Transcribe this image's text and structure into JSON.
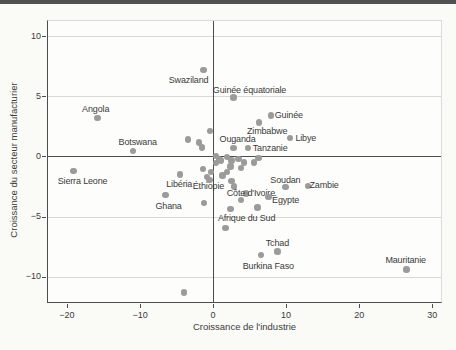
{
  "window": {
    "top_bar_color": "#515151",
    "background": "#fafaf7"
  },
  "chart_data": {
    "type": "scatter",
    "title": "",
    "xlabel": "Croissance de l'industrie",
    "ylabel": "Croissance du secteur manufacturier",
    "xlim": [
      -22.6,
      31.2
    ],
    "ylim": [
      -12.1,
      11.25
    ],
    "x_ticks": [
      -20,
      -10,
      0,
      10,
      20,
      30
    ],
    "y_ticks": [
      10,
      5,
      0,
      -5,
      -10
    ],
    "grid": "horizontal gridlines at -10,-5,5,10; dark zero axes both directions",
    "legend": "none",
    "point_color": "#9b9b9b",
    "axis_color": "#4d4d4d",
    "grid_color": "#d9d9d4",
    "labeled_points": [
      {
        "name": "Swaziland",
        "x": -1.3,
        "y": 7.2,
        "dx": -15,
        "dy": 10
      },
      {
        "name": "Guinée équatoriale",
        "x": 2.8,
        "y": 4.9,
        "dx": 16,
        "dy": -7
      },
      {
        "name": "Guinée",
        "x": 7.9,
        "y": 3.4,
        "dx": 18,
        "dy": 0
      },
      {
        "name": "Angola",
        "x": -15.8,
        "y": 3.2,
        "dx": -2,
        "dy": -9
      },
      {
        "name": "Zimbabwe",
        "x": 6.3,
        "y": 2.8,
        "dx": 8,
        "dy": 8
      },
      {
        "name": "Libye",
        "x": 10.5,
        "y": 1.55,
        "dx": 16,
        "dy": 0
      },
      {
        "name": "Botswana",
        "x": -11.0,
        "y": 0.45,
        "dx": 5,
        "dy": -9
      },
      {
        "name": "Ouganda",
        "x": 2.8,
        "y": 0.7,
        "dx": 4,
        "dy": -9
      },
      {
        "name": "Tanzanie",
        "x": 4.8,
        "y": 0.7,
        "dx": 22,
        "dy": 0
      },
      {
        "name": "Sierra Leone",
        "x": -19.1,
        "y": -1.2,
        "dx": 9,
        "dy": 10
      },
      {
        "name": "Libéria",
        "x": -4.5,
        "y": -1.5,
        "dx": -1,
        "dy": 10
      },
      {
        "name": "Éthiopie",
        "x": -0.5,
        "y": -1.95,
        "dx": -1,
        "dy": 6
      },
      {
        "name": "Ghana",
        "x": -6.5,
        "y": -3.2,
        "dx": 3,
        "dy": 11
      },
      {
        "name": "Côte d'Ivoire",
        "x": 3.8,
        "y": -3.6,
        "dx": 10,
        "dy": -7
      },
      {
        "name": "Égypte",
        "x": 7.6,
        "y": -3.4,
        "dx": 17,
        "dy": 3
      },
      {
        "name": "Soudan",
        "x": 9.9,
        "y": -2.55,
        "dx": 0,
        "dy": -7
      },
      {
        "name": "Zambie",
        "x": 13.0,
        "y": -2.45,
        "dx": 16,
        "dy": -1
      },
      {
        "name": "Afrique du Sud",
        "x": 2.4,
        "y": -4.35,
        "dx": 16,
        "dy": 9
      },
      {
        "name": "Tchad",
        "x": 8.8,
        "y": -7.9,
        "dx": 0,
        "dy": -8
      },
      {
        "name": "Burkina Faso",
        "x": 6.6,
        "y": -8.2,
        "dx": 7,
        "dy": 11
      },
      {
        "name": "Mauritanie",
        "x": 26.5,
        "y": -9.4,
        "dx": -1,
        "dy": -10
      }
    ],
    "unlabeled_points": [
      [
        -3.4,
        1.4
      ],
      [
        -1.9,
        1.15
      ],
      [
        -1.5,
        0.75
      ],
      [
        -0.4,
        2.1
      ],
      [
        0.4,
        0.05
      ],
      [
        0.8,
        -0.25
      ],
      [
        0.4,
        -0.55
      ],
      [
        1.1,
        -0.35
      ],
      [
        1.9,
        -0.05
      ],
      [
        2.5,
        -0.35
      ],
      [
        3.5,
        -0.2
      ],
      [
        4.2,
        -0.5
      ],
      [
        5.6,
        -0.5
      ],
      [
        6.2,
        -0.15
      ],
      [
        -1.4,
        -1.05
      ],
      [
        -0.3,
        -1.3
      ],
      [
        1.9,
        -1.3
      ],
      [
        -0.8,
        -1.7
      ],
      [
        1.3,
        -1.6
      ],
      [
        2.4,
        -0.85
      ],
      [
        3.8,
        -0.95
      ],
      [
        2.5,
        -2.05
      ],
      [
        2.9,
        -2.5
      ],
      [
        4.5,
        -3.1
      ],
      [
        -1.25,
        -3.85
      ],
      [
        6.1,
        -4.25
      ],
      [
        1.7,
        -5.95
      ],
      [
        -4.0,
        -11.3
      ]
    ]
  }
}
